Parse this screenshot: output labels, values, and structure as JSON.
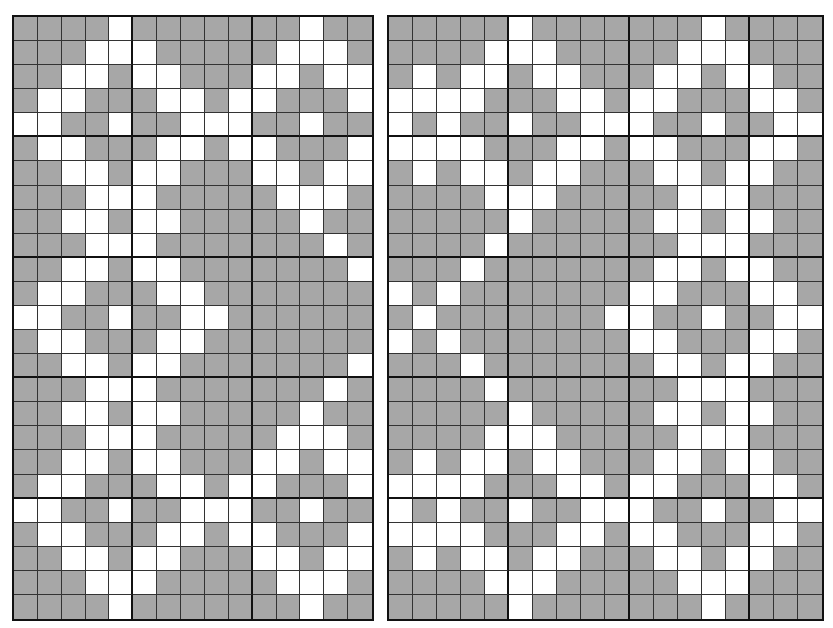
{
  "colors": {
    "filled": "#a7a7a7",
    "empty": "#ffffff",
    "line": "#111111"
  },
  "grids": [
    {
      "name": "left-pattern-grid",
      "cols": 15,
      "rows": 25,
      "block_cols": 5,
      "block_rows": 5,
      "left": 12,
      "top": 15,
      "width": 362,
      "height": 606,
      "cells": [
        "GGGGWGGGGGGGWGG",
        "GGGWWWGGGGGWWWG",
        "GGWWGWWGGGWWGWW",
        "GWWGGGWWGWWGGGW",
        "WWGGWGGWWWGGWGG",
        "GWWGGGWWGWWGGGW",
        "GGWWGWWGGGWWGWW",
        "GGGWWWGGGGGWWWG",
        "GGWWGWWGGGGGWGG",
        "GGGWWWGGGGGGGWG",
        "GGWWGWWGGGGGGGW",
        "GWWGGGWWGGGGGGG",
        "WWGGWGGWWGGGGGG",
        "GWWGGGWWGGGGGGG",
        "GGWWGWWGGGGGGGW",
        "GGGWWWGGGGGGGWG",
        "GGWWGWWGGGGGWGG",
        "GGGWWWGGGGGWWWG",
        "GGWWGWWGGGWWGWW",
        "GWWGGGWWGWWGGGW",
        "WWGGWGGWWWGGWGG",
        "GWWGGGWWGWWGGGW",
        "GGWWGWWGGGWWGWW",
        "GGGWWWGGGGGWWWG",
        "GGGGWGGGGGGGWGG"
      ]
    },
    {
      "name": "right-pattern-grid",
      "cols": 18,
      "rows": 25,
      "block_cols": 5,
      "block_rows": 5,
      "left": 387,
      "top": 15,
      "width": 437,
      "height": 606,
      "cells": [
        "GGGGGWGGGGGGGWGGGG",
        "GGGGWWWGGGGGWWWGGG",
        "GWGWWGWWGGGWWGWWGG",
        "WWWWGGGWWGWWGGGWWG",
        "WGWGGWGGWWWGGWGGWW",
        "WWWWGGGWWGWWGGGWWG",
        "GWGWWGWWGGGWWGWWGG",
        "GGGGWWWGGGGGWWWGGG",
        "GGGGGWGGGGGWWGWWGG",
        "GGGGWGGGGGGGWWWGGG",
        "GGGWGGGGGGGWWGWWGG",
        "WGWGGGGGGGWWGGGWWG",
        "GWGGGGGGGWWGGWGGWW",
        "WGWGGGGGGGWWGGGWWG",
        "GGGWGGGGGGGWWGWWGG",
        "GGGGWGGGGGGGWWWGGG",
        "GGGGGWGGGGGWWGWWGG",
        "GGGGWWWGGGGGWWWGGG",
        "GWGWWGWWGGGWWGWWGG",
        "WWWWGGGWWGWWGGGWWG",
        "WGWGGWGGWWWGGWGGWW",
        "WWWWGGGWWGWWGGGWWG",
        "GWGWWGWWGGGWWGWWGG",
        "GGGGWWWGGGGGWWWGGG",
        "GGGGGWGGGGGGGWGGGG"
      ]
    }
  ]
}
